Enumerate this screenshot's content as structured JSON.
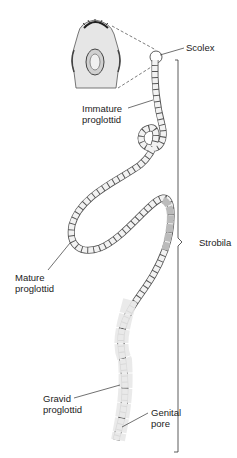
{
  "diagram": {
    "labels": {
      "scolex": "Scolex",
      "immature_line1": "Immature",
      "immature_line2": "proglottid",
      "strobila": "Strobila",
      "mature_line1": "Mature",
      "mature_line2": "proglottid",
      "gravid_line1": "Gravid",
      "gravid_line2": "proglottid",
      "genital_line1": "Genital",
      "genital_line2": "pore"
    },
    "colors": {
      "line": "#333333",
      "segment_fill": "#f2f2f2",
      "segment_shade": "#bdbdbd",
      "background": "#ffffff"
    }
  }
}
